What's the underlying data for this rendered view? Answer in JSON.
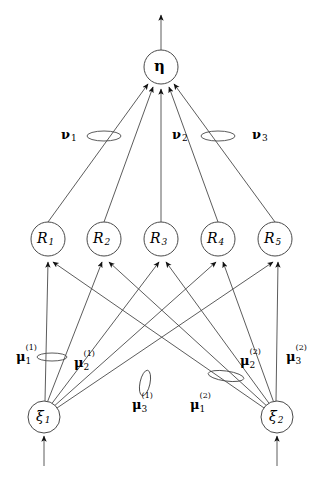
{
  "figure": {
    "type": "network-diagram",
    "title": "",
    "background": "#ffffff",
    "stroke": "#3a3a3a",
    "text_color": "#000000"
  },
  "output_node": {
    "id": "eta",
    "symbol": "η",
    "cx": 161,
    "cy": 67,
    "r": 17
  },
  "output_arrow": {
    "name": "eta-output-arrow",
    "x": 161,
    "y_from": 50,
    "y_to": 14
  },
  "hidden_nodes": [
    {
      "id": "R1",
      "symbol": "R",
      "index": "1",
      "cx": 48,
      "cy": 239,
      "r": 17
    },
    {
      "id": "R2",
      "symbol": "R",
      "index": "2",
      "cx": 104,
      "cy": 239,
      "r": 17
    },
    {
      "id": "R3",
      "symbol": "R",
      "index": "3",
      "cx": 161,
      "cy": 239,
      "r": 17
    },
    {
      "id": "R4",
      "symbol": "R",
      "index": "4",
      "cx": 218,
      "cy": 239,
      "r": 17
    },
    {
      "id": "R5",
      "symbol": "R",
      "index": "5",
      "cx": 275,
      "cy": 239,
      "r": 17
    }
  ],
  "input_nodes": [
    {
      "id": "xi1",
      "symbol": "ξ",
      "index": "1",
      "cx": 44,
      "cy": 417,
      "r": 16
    },
    {
      "id": "xi2",
      "symbol": "ξ",
      "index": "2",
      "cx": 277,
      "cy": 417,
      "r": 16
    }
  ],
  "input_arrows": [
    {
      "name": "xi1-input-arrow",
      "x": 44,
      "y_from": 466,
      "y_to": 435
    },
    {
      "name": "xi2-input-arrow",
      "x": 277,
      "y_from": 466,
      "y_to": 435
    }
  ],
  "nu_labels": [
    {
      "id": "nu1",
      "symbol": "ν",
      "index": "1",
      "x": 61,
      "y": 130
    },
    {
      "id": "nu2",
      "symbol": "ν",
      "index": "2",
      "x": 172,
      "y": 130
    },
    {
      "id": "nu3",
      "symbol": "ν",
      "index": "3",
      "x": 252,
      "y": 130
    }
  ],
  "nu_ellipses": [
    {
      "id": "nu1-ellipse",
      "cx": 104,
      "cy": 136,
      "rx": 17,
      "ry": 5,
      "rotate": 0
    },
    {
      "id": "nu2-ellipse",
      "cx": 218,
      "cy": 136,
      "rx": 17,
      "ry": 5,
      "rotate": 0
    },
    {
      "id": "nu3-ellipse",
      "cx": 218,
      "cy": 136,
      "rx": 17,
      "ry": 5,
      "rotate": 0
    }
  ],
  "mu_labels": [
    {
      "id": "mu1_1",
      "symbol": "μ",
      "sub": "1",
      "sup": "(1)",
      "x": 16,
      "y": 352
    },
    {
      "id": "mu2_1",
      "symbol": "μ",
      "sub": "2",
      "sup": "(1)",
      "x": 74,
      "y": 358
    },
    {
      "id": "mu3_1",
      "symbol": "μ",
      "sub": "3",
      "sup": "(1)",
      "x": 132,
      "y": 400
    },
    {
      "id": "mu1_2",
      "symbol": "μ",
      "sub": "1",
      "sup": "(2)",
      "x": 190,
      "y": 400
    },
    {
      "id": "mu2_2",
      "symbol": "μ",
      "sub": "2",
      "sup": "(2)",
      "x": 240,
      "y": 356
    },
    {
      "id": "mu3_2",
      "symbol": "μ",
      "sub": "3",
      "sup": "(2)",
      "x": 286,
      "y": 352
    }
  ],
  "mu_ellipses": [
    {
      "id": "mu1_1-ellipse",
      "cx": 52,
      "cy": 357,
      "rx": 15,
      "ry": 4,
      "rotate": 0
    },
    {
      "id": "mu3_1-ellipse",
      "cx": 145,
      "cy": 383,
      "rx": 5,
      "ry": 13,
      "rotate": 12
    },
    {
      "id": "mu2_2-ellipse",
      "cx": 226,
      "cy": 376,
      "rx": 18,
      "ry": 5,
      "rotate": 8
    }
  ],
  "edges_hidden_to_output": [
    {
      "from": "R1",
      "to": "eta"
    },
    {
      "from": "R2",
      "to": "eta"
    },
    {
      "from": "R3",
      "to": "eta"
    },
    {
      "from": "R4",
      "to": "eta"
    },
    {
      "from": "R5",
      "to": "eta"
    }
  ],
  "edges_input_to_hidden": [
    {
      "from": "xi1",
      "to": "R1"
    },
    {
      "from": "xi1",
      "to": "R2"
    },
    {
      "from": "xi1",
      "to": "R3"
    },
    {
      "from": "xi1",
      "to": "R4"
    },
    {
      "from": "xi1",
      "to": "R5"
    },
    {
      "from": "xi2",
      "to": "R1"
    },
    {
      "from": "xi2",
      "to": "R2"
    },
    {
      "from": "xi2",
      "to": "R3"
    },
    {
      "from": "xi2",
      "to": "R4"
    },
    {
      "from": "xi2",
      "to": "R5"
    }
  ]
}
